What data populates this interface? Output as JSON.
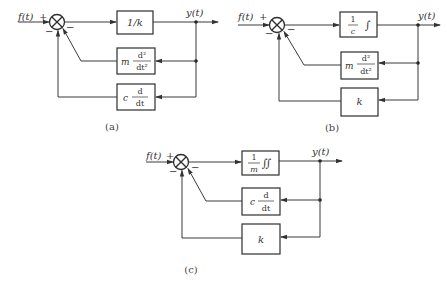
{
  "figure": {
    "diagrams": [
      {
        "id": "a",
        "caption": "(a)",
        "input_label": "f(t)",
        "input_sign": "+",
        "output_label": "y(t)",
        "feedback_signs": [
          "−",
          "−"
        ],
        "forward_block": {
          "text": "1/k"
        },
        "feedback_blocks": [
          {
            "coef": "m",
            "num": "d²",
            "den": "dt²"
          },
          {
            "coef": "c",
            "num": "d",
            "den": "dt"
          }
        ]
      },
      {
        "id": "b",
        "caption": "(b)",
        "input_label": "f(t)",
        "input_sign": "+",
        "output_label": "y(t)",
        "feedback_signs": [
          "−",
          "−"
        ],
        "forward_block": {
          "num": "1",
          "den": "c",
          "op": "∫"
        },
        "feedback_blocks": [
          {
            "coef": "m",
            "num": "d²",
            "den": "dt²"
          },
          {
            "text": "k"
          }
        ]
      },
      {
        "id": "c",
        "caption": "(c)",
        "input_label": "f(t)",
        "input_sign": "+",
        "output_label": "y(t)",
        "feedback_signs": [
          "−",
          "−"
        ],
        "forward_block": {
          "num": "1",
          "den": "m",
          "op": "∬"
        },
        "feedback_blocks": [
          {
            "coef": "c",
            "num": "d",
            "den": "dt"
          },
          {
            "text": "k"
          }
        ]
      }
    ]
  }
}
